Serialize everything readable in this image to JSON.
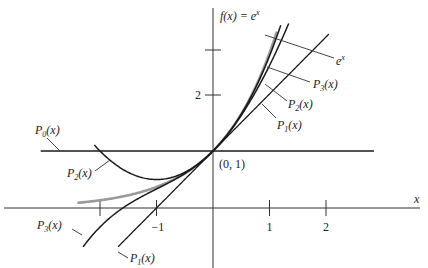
{
  "chart_data": {
    "type": "line",
    "title": "",
    "ylabel": "f(x) = e^x",
    "xlabel": "x",
    "x_ticks": [
      {
        "value": -2,
        "label": ""
      },
      {
        "value": -1,
        "label": "−1"
      },
      {
        "value": 1,
        "label": "1"
      },
      {
        "value": 2,
        "label": "2"
      }
    ],
    "y_ticks": [
      {
        "value": 2,
        "label": "2"
      },
      {
        "value": 2.8,
        "label": ""
      }
    ],
    "xlim": [
      -3.75,
      3.6
    ],
    "ylim": [
      -1.0,
      3.5
    ],
    "grid": false,
    "annotation_point": {
      "x": 0,
      "y": 1,
      "label": "(0, 1)"
    },
    "series": [
      {
        "name": "e^x",
        "label": "e^x",
        "expr": "exp",
        "color": "#9a9a9a",
        "width": 2.6,
        "domain": [
          -2.4,
          1.13
        ]
      },
      {
        "name": "P0(x)",
        "label": "P0(x)",
        "expr": "p0",
        "color": "#1a1a1a",
        "width": 1.3,
        "domain": [
          -3.05,
          2.85
        ]
      },
      {
        "name": "P1(x)",
        "label": "P1(x)",
        "expr": "p1",
        "color": "#1a1a1a",
        "width": 1.3,
        "domain": [
          -1.68,
          2.05
        ]
      },
      {
        "name": "P2(x)",
        "label": "P2(x)",
        "expr": "p2",
        "color": "#1a1a1a",
        "width": 1.5,
        "domain": [
          -2.1,
          1.34
        ]
      },
      {
        "name": "P3(x)",
        "label": "P3(x)",
        "expr": "p3",
        "color": "#1a1a1a",
        "width": 1.5,
        "domain": [
          -2.3,
          1.2
        ]
      }
    ],
    "legend_position": "inline callouts"
  }
}
